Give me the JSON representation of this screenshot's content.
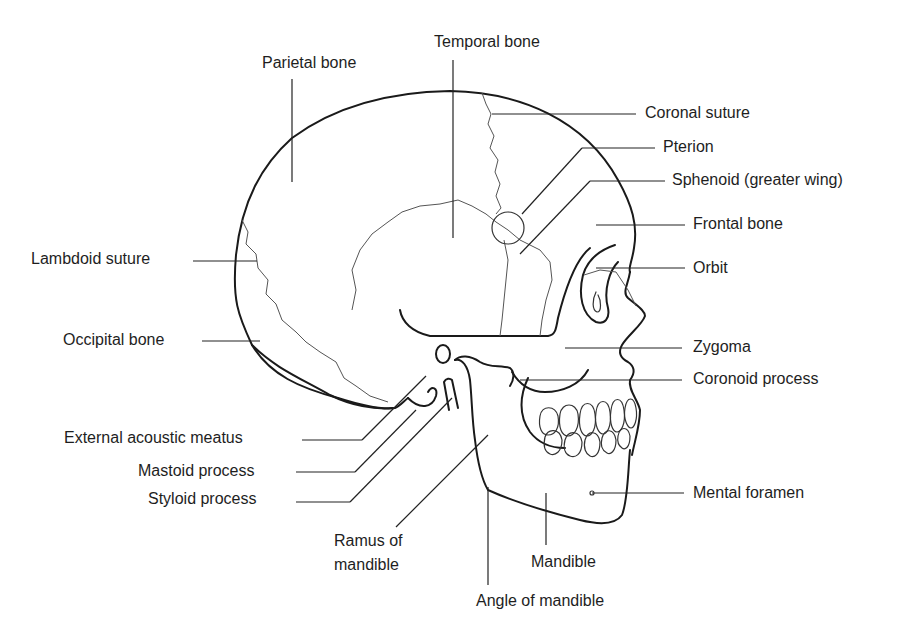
{
  "figure": {
    "labels": {
      "parietal_bone": "Parietal bone",
      "temporal_bone": "Temporal bone",
      "coronal_suture": "Coronal suture",
      "pterion": "Pterion",
      "sphenoid": "Sphenoid (greater wing)",
      "frontal_bone": "Frontal bone",
      "lambdoid_suture": "Lambdoid suture",
      "orbit": "Orbit",
      "occipital_bone": "Occipital bone",
      "zygoma": "Zygoma",
      "coronoid_process": "Coronoid process",
      "external_acoustic_meatus": "External acoustic meatus",
      "mastoid_process": "Mastoid process",
      "styloid_process": "Styloid process",
      "mental_foramen": "Mental foramen",
      "ramus_line1": "Ramus of",
      "ramus_line2": "mandible",
      "mandible": "Mandible",
      "angle_of_mandible": "Angle of mandible"
    }
  }
}
